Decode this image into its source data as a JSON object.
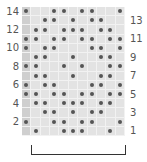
{
  "chart_data": {
    "type": "knitting-chart",
    "columns": 11,
    "rows": 14,
    "legend_symbol": "dot",
    "row_labels_left": [
      "14",
      "12",
      "10",
      "8",
      "6",
      "4",
      "2"
    ],
    "row_labels_right": [
      "13",
      "11",
      "9",
      "7",
      "5",
      "3",
      "1"
    ],
    "edge_column_shaded": true,
    "pattern_repeat_bracket": {
      "from_col": 1,
      "to_col": 10
    },
    "dots_by_row": {
      "14": [
        0,
        3,
        4,
        6,
        7,
        10
      ],
      "13": [
        2,
        3,
        5,
        7,
        8
      ],
      "12": [
        1,
        2,
        4,
        5,
        6,
        8,
        9
      ],
      "11": [
        0,
        1,
        3,
        4,
        6,
        7,
        9,
        10
      ],
      "10": [
        0,
        2,
        3,
        7,
        8,
        10
      ],
      "9": [
        1,
        2,
        5,
        8,
        9
      ],
      "8": [
        0,
        1,
        4,
        6,
        9,
        10
      ],
      "7": [
        1,
        2,
        5,
        8,
        9
      ],
      "6": [
        0,
        2,
        3,
        7,
        8,
        10
      ],
      "5": [
        0,
        1,
        3,
        4,
        6,
        7,
        9,
        10
      ],
      "4": [
        1,
        2,
        4,
        5,
        6,
        8,
        9
      ],
      "3": [
        2,
        3,
        5,
        7,
        8
      ],
      "2": [
        0,
        3,
        4,
        6,
        7,
        10
      ],
      "1": [
        1,
        4,
        5,
        6,
        9
      ]
    }
  },
  "labels": {
    "left": [
      {
        "text": "14",
        "row": 14
      },
      {
        "text": "12",
        "row": 12
      },
      {
        "text": "10",
        "row": 10
      },
      {
        "text": "8",
        "row": 8
      },
      {
        "text": "6",
        "row": 6
      },
      {
        "text": "4",
        "row": 4
      },
      {
        "text": "2",
        "row": 2
      }
    ],
    "right": [
      {
        "text": "13",
        "row": 13
      },
      {
        "text": "11",
        "row": 11
      },
      {
        "text": "9",
        "row": 9
      },
      {
        "text": "7",
        "row": 7
      },
      {
        "text": "5",
        "row": 5
      },
      {
        "text": "3",
        "row": 3
      },
      {
        "text": "1",
        "row": 1
      }
    ]
  },
  "colors": {
    "cell": "#e3e3e3",
    "edge": "#cfcfcf",
    "dot": "#555555",
    "bracket": "#333333"
  }
}
